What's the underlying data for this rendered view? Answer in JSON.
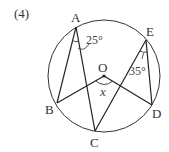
{
  "problem_label": "(4)",
  "circle": {
    "center_label": "O",
    "cx": 104,
    "cy": 76,
    "r": 56
  },
  "points": {
    "A": {
      "label": "A",
      "x": 76,
      "y": 27
    },
    "B": {
      "label": "B",
      "x": 57,
      "y": 103
    },
    "C": {
      "label": "C",
      "x": 95,
      "y": 131
    },
    "D": {
      "label": "D",
      "x": 152,
      "y": 105
    },
    "E": {
      "label": "E",
      "x": 146,
      "y": 40
    },
    "O": {
      "label": "O",
      "x": 104,
      "y": 76
    }
  },
  "angles": {
    "angle_A": {
      "value": "25°",
      "at": "A",
      "between": [
        "B",
        "C"
      ]
    },
    "angle_E": {
      "value": "35°",
      "at": "E",
      "between": [
        "C",
        "D"
      ]
    },
    "angle_O": {
      "value": "x",
      "at": "O",
      "between": [
        "B",
        "D"
      ]
    }
  },
  "colors": {
    "stroke": "#333333",
    "background": "#ffffff"
  }
}
